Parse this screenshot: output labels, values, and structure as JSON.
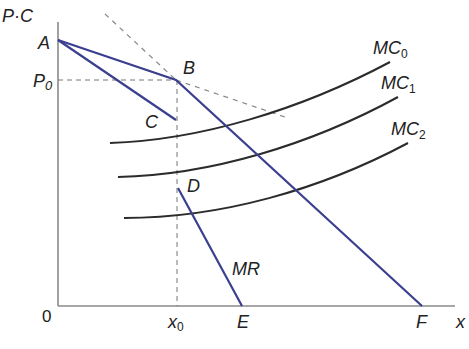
{
  "diagram": {
    "type": "economics-kinked-demand",
    "axes": {
      "y_label": "P·C",
      "x_label": "x",
      "origin_label": "0"
    },
    "points": {
      "A": {
        "label": "A",
        "x": 58,
        "y": 40
      },
      "B": {
        "label": "B",
        "x": 176,
        "y": 80
      },
      "C": {
        "label": "C",
        "x": 176,
        "y": 120
      },
      "D": {
        "label": "D",
        "x": 178,
        "y": 188
      },
      "E": {
        "label": "E",
        "x": 242,
        "y": 306
      },
      "F": {
        "label": "F",
        "x": 422,
        "y": 306
      }
    },
    "ticks": {
      "P0": "P",
      "P0_sub": "0",
      "x0": "x",
      "x0_sub": "0"
    },
    "curves": {
      "MC0": {
        "label": "MC",
        "sub": "0"
      },
      "MC1": {
        "label": "MC",
        "sub": "1"
      },
      "MC2": {
        "label": "MC",
        "sub": "2"
      },
      "MR": {
        "label": "MR"
      }
    },
    "colors": {
      "demand_line": "#3a3f8f",
      "mc_curve": "#2b2b2b",
      "axis": "#888888",
      "dashed": "#777777"
    }
  }
}
